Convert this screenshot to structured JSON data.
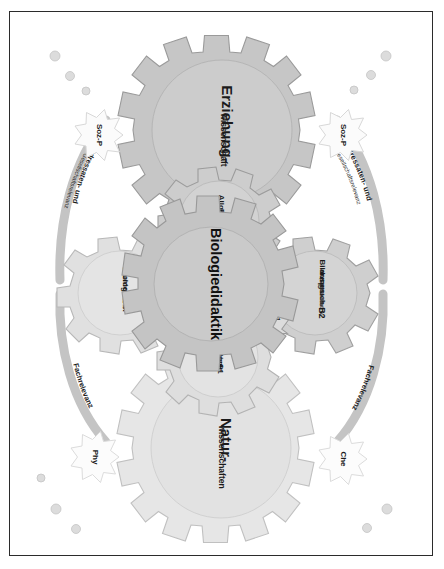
{
  "figure": {
    "background_color": "#ffffff",
    "border_color": "#2b2b2b"
  },
  "palette": {
    "gear_core_fill": "#c9c9c9",
    "gear_core_stroke": "#9a9a9a",
    "gear_mid_fill": "#cfcfcf",
    "gear_mid_stroke": "#8f8f8f",
    "gear_light_fill": "#e2e2e2",
    "gear_light_stroke": "#a8a8a8",
    "gear_white_fill": "#fbfbfb",
    "gear_white_stroke": "#d6d6d6",
    "arrow_fill": "#dcdcdc",
    "arrow_stroke": "#9b9b9b",
    "arc_fill": "#c4c4c4",
    "dot_fill": "#d8d8d8",
    "text_color": "#1b1b1b"
  },
  "gears": {
    "center": {
      "id": "biologiedidaktik",
      "label": "Biologiedidaktik",
      "sublabel": "",
      "code": "",
      "teeth": 12,
      "style": "core"
    },
    "erziehungswissenschaft": {
      "id": "erziehungswissenschaft",
      "label": "Erziehung-",
      "sublabel": "wissenschaft",
      "code": "",
      "teeth": 12,
      "style": "mid"
    },
    "naturwissenschaften": {
      "id": "naturwissenschaften",
      "label": "Natur-",
      "sublabel": "wissenschaften",
      "code": "",
      "teeth": 12,
      "style": "light"
    },
    "allgemeine_didaktik": {
      "id": "allgemeine-didaktik",
      "label": "Allgemeine",
      "sublabel": "Didaktik*",
      "code": "",
      "teeth": 8,
      "style": "mid"
    },
    "allgemeine_biologie": {
      "id": "allgemeine-biologie",
      "label": "Allgemeine",
      "sublabel": "Biologie",
      "code": "B1",
      "teeth": 8,
      "style": "light"
    },
    "bildungsanspruch": {
      "id": "bildungsanspruch",
      "label": "Bildungs-",
      "sublabel": "anspruch",
      "detail": "(Gesellschaft /",
      "detail2": "Individuum)",
      "code": "B2",
      "teeth": 8,
      "style": "mid"
    },
    "biologieunterricht": {
      "id": "biologieunterricht",
      "label": "Biologie-",
      "sublabel": "unterricht",
      "code": "B3",
      "teeth": 8,
      "style": "light"
    }
  },
  "satellite_gears": [
    {
      "id": "soz-p-upper",
      "label": "Soz-P"
    },
    {
      "id": "soz-p-lower",
      "label": "Soz-P"
    },
    {
      "id": "chemie",
      "label": "Che"
    },
    {
      "id": "physik",
      "label": "Phy"
    }
  ],
  "arrows": [
    {
      "id": "arrow-u1",
      "label": "U1",
      "from": "bildungsanspruch",
      "to": "biologiedidaktik"
    },
    {
      "id": "arrow-u2",
      "label": "U2",
      "from": "biologiedidaktik",
      "to": "bildungsanspruch"
    },
    {
      "id": "arrow-u3",
      "label": "U3",
      "from": "biologiedidaktik",
      "to": "biologieunterricht"
    },
    {
      "id": "arrow-u4",
      "label": "U4",
      "from": "biologieunterricht",
      "to": "biologiedidaktik"
    }
  ],
  "arcs": [
    {
      "id": "arc-adressaten-top",
      "line1": "Adressaten- und",
      "line2": "Gesellschaftsrelevanz",
      "side": "erziehungswissenschaft-upper"
    },
    {
      "id": "arc-adressaten-bottom",
      "line1": "Adressaten- und",
      "line2": "Gesellschaftsrelevanz",
      "side": "erziehungswissenschaft-lower"
    },
    {
      "id": "arc-fachrelevanz-top",
      "line1": "Fachrelevanz",
      "line2": "",
      "side": "naturwissenschaften-upper"
    },
    {
      "id": "arc-fachrelevanz-bottom",
      "line1": "Fachrelevanz",
      "line2": "",
      "side": "naturwissenschaften-lower"
    }
  ]
}
